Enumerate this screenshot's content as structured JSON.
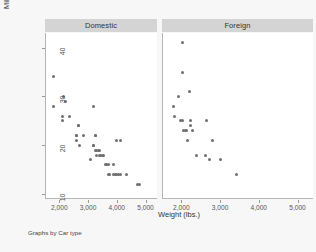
{
  "figure": {
    "background_color": "#f7f7f7",
    "panel_background_color": "#ffffff",
    "header_background_color": "#d4d4d4",
    "marker_color": "#6f6f6f",
    "axis_color": "#b5b5b5",
    "footnote": "Graphs by Car type"
  },
  "chart_data": {
    "type": "scatter",
    "title": "",
    "subtitle": "",
    "xlabel": "Weight (lbs.)",
    "ylabel": "Mileage (mpg)",
    "xlim": [
      1500,
      5400
    ],
    "ylim": [
      9,
      43
    ],
    "xticks": [
      2000,
      3000,
      4000,
      5000
    ],
    "xtick_labels": [
      "2,000",
      "3,000",
      "4,000",
      "5,000"
    ],
    "yticks": [
      10,
      20,
      30,
      40
    ],
    "ytick_labels": [
      "10",
      "20",
      "30",
      "40"
    ],
    "grid": false,
    "legend": false,
    "facet_by": "Car type",
    "panels": [
      {
        "label": "Domestic",
        "x": "weight",
        "y": "mpg",
        "points": [
          [
            1800,
            34
          ],
          [
            1800,
            28
          ],
          [
            2130,
            30
          ],
          [
            2230,
            29
          ],
          [
            2110,
            26
          ],
          [
            2100,
            25
          ],
          [
            2370,
            26
          ],
          [
            2650,
            24
          ],
          [
            2650,
            24
          ],
          [
            2580,
            22
          ],
          [
            2580,
            22
          ],
          [
            2590,
            21
          ],
          [
            2690,
            20
          ],
          [
            2830,
            22
          ],
          [
            3200,
            28
          ],
          [
            3250,
            22
          ],
          [
            3250,
            22
          ],
          [
            3180,
            20
          ],
          [
            3200,
            20
          ],
          [
            3300,
            19
          ],
          [
            3350,
            19
          ],
          [
            3400,
            19
          ],
          [
            3250,
            19
          ],
          [
            3300,
            18
          ],
          [
            3400,
            18
          ],
          [
            3430,
            18
          ],
          [
            3500,
            18
          ],
          [
            3550,
            18
          ],
          [
            3100,
            17
          ],
          [
            3600,
            16
          ],
          [
            3650,
            16
          ],
          [
            3700,
            16
          ],
          [
            3900,
            16
          ],
          [
            3980,
            21
          ],
          [
            4130,
            21
          ],
          [
            3700,
            14
          ],
          [
            3750,
            14
          ],
          [
            3900,
            14
          ],
          [
            3950,
            14
          ],
          [
            4000,
            14
          ],
          [
            4060,
            14
          ],
          [
            4130,
            14
          ],
          [
            4330,
            14
          ],
          [
            4720,
            12
          ],
          [
            4800,
            12
          ]
        ]
      },
      {
        "label": "Foreign",
        "x": "weight",
        "y": "mpg",
        "points": [
          [
            2020,
            41
          ],
          [
            2040,
            35
          ],
          [
            2200,
            31
          ],
          [
            1930,
            30
          ],
          [
            1800,
            28
          ],
          [
            1830,
            26
          ],
          [
            1980,
            25
          ],
          [
            2030,
            25
          ],
          [
            2230,
            25
          ],
          [
            2650,
            25
          ],
          [
            2050,
            23
          ],
          [
            2100,
            23
          ],
          [
            2130,
            23
          ],
          [
            2240,
            24
          ],
          [
            2280,
            23
          ],
          [
            2160,
            21
          ],
          [
            2800,
            21
          ],
          [
            2400,
            18
          ],
          [
            2620,
            18
          ],
          [
            2730,
            17
          ],
          [
            3000,
            17
          ],
          [
            3430,
            14
          ]
        ]
      }
    ]
  }
}
